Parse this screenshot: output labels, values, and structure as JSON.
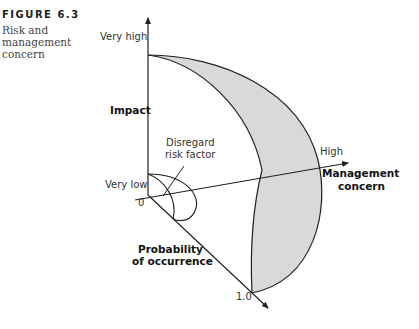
{
  "figure": {
    "number": "FIGURE 6.3",
    "title": "Risk and management concern"
  },
  "diagram": {
    "axes": {
      "impact": {
        "label": "Impact",
        "high": "Very high",
        "low": "Very low"
      },
      "management_concern": {
        "label_line1": "Management",
        "label_line2": "concern",
        "high": "High"
      },
      "probability": {
        "label_line1": "Probability",
        "label_line2": "of occurrence",
        "origin": "0",
        "max": "1.0"
      }
    },
    "annotation": {
      "line1": "Disregard",
      "line2": "risk factor"
    },
    "colors": {
      "shaded_region": "#d9d9d9",
      "stroke": "#222222"
    }
  }
}
